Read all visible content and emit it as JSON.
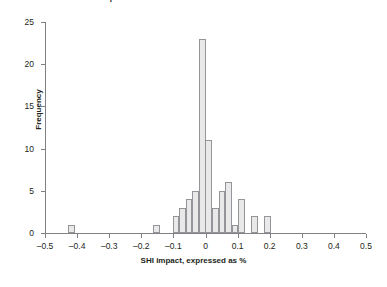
{
  "chart_data": {
    "type": "bar",
    "title": "p-value estimates from DiNo in DiNo Model",
    "xlabel": "SHI impact, expressed as %",
    "ylabel": "Frequency",
    "xlim": [
      -0.5,
      0.5
    ],
    "ylim": [
      0,
      25
    ],
    "xticks": [
      "-0.5",
      "-0.4",
      "-0.3",
      "-0.2",
      "-0.1",
      "0",
      "0.1",
      "0.2",
      "0.3",
      "0.4",
      "0.5"
    ],
    "xtick_values": [
      -0.5,
      -0.4,
      -0.3,
      -0.2,
      -0.1,
      0,
      0.1,
      0.2,
      0.3,
      0.4,
      0.5
    ],
    "yticks": [
      "0",
      "5",
      "10",
      "15",
      "20",
      "25"
    ],
    "ytick_values": [
      0,
      5,
      10,
      15,
      20,
      25
    ],
    "grid": false,
    "legend": "none",
    "bin_width": 0.0204,
    "bars": [
      {
        "x": -0.418,
        "value": 1
      },
      {
        "x": -0.153,
        "value": 1
      },
      {
        "x": -0.092,
        "value": 2
      },
      {
        "x": -0.071,
        "value": 3
      },
      {
        "x": -0.051,
        "value": 4
      },
      {
        "x": -0.031,
        "value": 5
      },
      {
        "x": -0.01,
        "value": 23
      },
      {
        "x": 0.01,
        "value": 11
      },
      {
        "x": 0.031,
        "value": 3
      },
      {
        "x": 0.051,
        "value": 5
      },
      {
        "x": 0.071,
        "value": 6
      },
      {
        "x": 0.092,
        "value": 1
      },
      {
        "x": 0.112,
        "value": 4
      },
      {
        "x": 0.153,
        "value": 2
      },
      {
        "x": 0.194,
        "value": 2
      }
    ],
    "colors": {
      "bar_fill": "#e9e9e9",
      "bar_stroke": "#939598",
      "axis": "#808184",
      "text": "#231f20",
      "background": "#ffffff"
    }
  }
}
